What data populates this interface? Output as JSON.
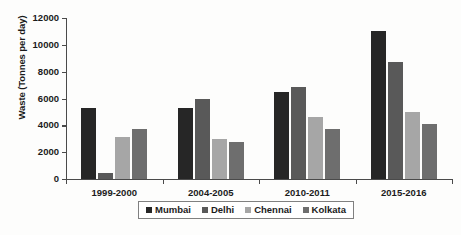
{
  "chart_data": {
    "type": "bar",
    "title": "",
    "xlabel": "",
    "ylabel": "Waste (Tonnes per day)",
    "categories": [
      "1999-2000",
      "2004-2005",
      "2010-2011",
      "2015-2016"
    ],
    "series": [
      {
        "name": "Mumbai",
        "color": "#262626",
        "values": [
          5300,
          5300,
          6500,
          11000
        ]
      },
      {
        "name": "Delhi",
        "color": "#595959",
        "values": [
          450,
          5950,
          6850,
          8700
        ]
      },
      {
        "name": "Chennai",
        "color": "#a6a6a6",
        "values": [
          3100,
          3000,
          4600,
          5000
        ]
      },
      {
        "name": "Kolkata",
        "color": "#6e6e6e",
        "values": [
          3750,
          2750,
          3700,
          4100
        ]
      }
    ],
    "ylim": [
      0,
      12000
    ],
    "ytick_step": 2000,
    "yticks": [
      0,
      2000,
      4000,
      6000,
      8000,
      10000,
      12000
    ],
    "ytick_labels": [
      "0",
      "2000",
      "4000",
      "6000",
      "8000",
      "10000",
      "12000"
    ],
    "grid": false,
    "legend_position": "bottom"
  },
  "legend": {
    "items": [
      {
        "label": "Mumbai",
        "color": "#262626"
      },
      {
        "label": "Delhi",
        "color": "#595959"
      },
      {
        "label": "Chennai",
        "color": "#a6a6a6"
      },
      {
        "label": "Kolkata",
        "color": "#6e6e6e"
      }
    ]
  }
}
